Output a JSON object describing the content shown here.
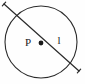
{
  "figure": {
    "type": "geometry-diagram",
    "background_color": "#fefefe",
    "stroke_color": "#2b2b2b",
    "label_color": "#1a1a1a"
  },
  "circle": {
    "name": "circle",
    "center_x": 41,
    "center_y": 42,
    "radius": 36,
    "stroke_width": 1.1
  },
  "center_point": {
    "label": "P",
    "dot_x": 41,
    "dot_y": 43,
    "dot_radius": 2.4,
    "label_x": 28,
    "label_y": 46
  },
  "line": {
    "label": "l",
    "label_x": 59,
    "label_y": 44,
    "x1": 4,
    "y1": 4,
    "x2": 79,
    "y2": 71,
    "stroke_width": 1.2,
    "tick_size": 5
  },
  "labels": [
    {
      "text": "P",
      "role": "center-point-label"
    },
    {
      "text": "l",
      "role": "line-label"
    }
  ]
}
